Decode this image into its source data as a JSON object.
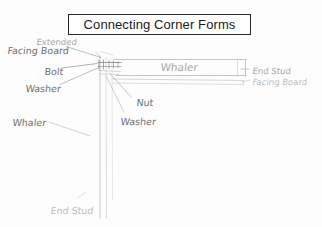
{
  "document": {
    "type": "hand-drawn construction detail sketch",
    "title": "Connecting Corner Forms"
  },
  "title_box": {
    "text": "Connecting Corner Forms"
  },
  "labels": [
    {
      "id": "extended",
      "text": "Extended",
      "x": 36,
      "y": 38,
      "size": "s9",
      "tone": "light"
    },
    {
      "id": "facing-board-left",
      "text": "Facing Board",
      "x": 7,
      "y": 46,
      "size": "s10",
      "tone": "dark"
    },
    {
      "id": "bolt",
      "text": "Bolt",
      "x": 44,
      "y": 67,
      "size": "s10",
      "tone": "dark"
    },
    {
      "id": "washer-left",
      "text": "Washer",
      "x": 25,
      "y": 84,
      "size": "s10",
      "tone": "dark"
    },
    {
      "id": "whaler-top",
      "text": "Whaler",
      "x": 160,
      "y": 62,
      "size": "s11",
      "tone": "light"
    },
    {
      "id": "end-stud-right",
      "text": "End Stud",
      "x": 252,
      "y": 67,
      "size": "s9",
      "tone": "light"
    },
    {
      "id": "facing-board-right",
      "text": "Facing Board",
      "x": 252,
      "y": 78,
      "size": "s9",
      "tone": "vlight"
    },
    {
      "id": "nut",
      "text": "Nut",
      "x": 136,
      "y": 98,
      "size": "s10",
      "tone": "dark"
    },
    {
      "id": "whaler-left",
      "text": "Whaler",
      "x": 12,
      "y": 118,
      "size": "s10",
      "tone": "dark"
    },
    {
      "id": "washer-center",
      "text": "Washer",
      "x": 120,
      "y": 117,
      "size": "s10",
      "tone": "dark"
    },
    {
      "id": "end-stud-bottom",
      "text": "End Stud",
      "x": 50,
      "y": 206,
      "size": "s10",
      "tone": "vlight"
    }
  ],
  "colors": {
    "paper": "#fdfdfd",
    "ink_dark": "#6f6f6f",
    "ink_mid": "#8d8d8d",
    "ink_light": "#bdbdbd",
    "title_border": "#2a2a2a",
    "title_text": "#1c1c1c"
  }
}
